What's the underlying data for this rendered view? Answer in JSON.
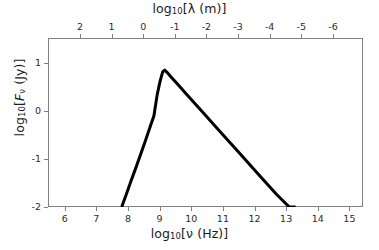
{
  "figure": {
    "background_color": "#ffffff",
    "frame_color": "#808080",
    "curve_color": "#000000",
    "curve_width_px": 3
  },
  "axes": {
    "bottom": {
      "title_html": "log<sub>10</sub>[&#957; (Hz)]",
      "title_plain": "log10[nu (Hz)]",
      "ticks": [
        6,
        7,
        8,
        9,
        10,
        11,
        12,
        13,
        14,
        15
      ],
      "range": [
        5.47,
        15.43
      ]
    },
    "top": {
      "title_html": "log<sub>10</sub>[&#955; (m)]",
      "title_plain": "log10[lambda (m)]",
      "ticks": [
        2,
        1,
        0,
        -1,
        -2,
        -3,
        -4,
        -5,
        -6
      ],
      "note": "wavelength axis, decreases left to right"
    },
    "left": {
      "title_html": "log<sub>10</sub>[<span class=\"ital\">F</span><sub>&#957;</sub> (Jy)]",
      "title_plain": "log10[F_nu (Jy)]",
      "ticks": [
        1,
        0,
        -1,
        -2
      ],
      "range": [
        -2,
        1.52
      ]
    }
  },
  "chart_data": {
    "type": "line",
    "title": "",
    "xlabel": "log10[nu (Hz)]",
    "ylabel": "log10[F_nu (Jy)]",
    "xlim": [
      5.47,
      15.43
    ],
    "ylim": [
      -2.0,
      1.52
    ],
    "grid": false,
    "legend": null,
    "x_tick_labels": [
      "6",
      "7",
      "8",
      "9",
      "10",
      "11",
      "12",
      "13",
      "14",
      "15"
    ],
    "y_tick_labels": [
      "1",
      "0",
      "-1",
      "-2"
    ],
    "secondary_x_axis": {
      "label": "log10[lambda (m)]",
      "tick_labels": [
        "2",
        "1",
        "0",
        "-1",
        "-2",
        "-3",
        "-4",
        "-5",
        "-6"
      ],
      "tick_values_on_primary": [
        6.48,
        7.48,
        8.48,
        9.48,
        10.48,
        11.48,
        12.48,
        13.48,
        14.48
      ]
    },
    "series": [
      {
        "name": "spectrum",
        "color": "#000000",
        "peak": {
          "x": 9.1,
          "y": 0.85
        },
        "x": [
          7.8,
          7.95,
          8.1,
          8.25,
          8.4,
          8.55,
          8.7,
          8.82,
          8.92,
          9.0,
          9.06,
          9.1,
          9.16,
          9.24,
          9.36,
          9.55,
          9.85,
          10.3,
          10.9,
          11.5,
          12.1,
          12.7,
          13.1,
          13.3
        ],
        "y": [
          -2.0,
          -1.73,
          -1.45,
          -1.18,
          -0.9,
          -0.62,
          -0.33,
          -0.1,
          0.33,
          0.58,
          0.73,
          0.82,
          0.85,
          0.8,
          0.71,
          0.57,
          0.35,
          0.02,
          -0.42,
          -0.86,
          -1.3,
          -1.74,
          -2.0,
          -2.0
        ]
      }
    ]
  }
}
